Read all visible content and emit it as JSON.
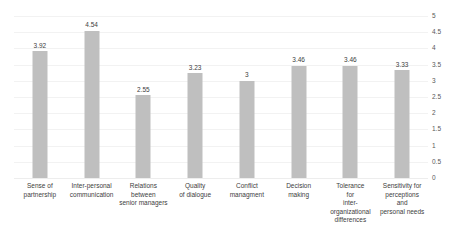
{
  "chart_data": {
    "type": "bar",
    "title": "",
    "subtitle": "",
    "xlabel": "",
    "ylabel": "",
    "ylim": [
      0,
      5
    ],
    "y_ticks": [
      "0",
      "0.5",
      "1",
      "1.5",
      "2",
      "2.5",
      "3",
      "3.5",
      "4",
      "4.5",
      "5"
    ],
    "y_tick_values": [
      0,
      0.5,
      1,
      1.5,
      2,
      2.5,
      3,
      3.5,
      4,
      4.5,
      5
    ],
    "grid": true,
    "legend": "none",
    "y_axis_position": "right",
    "bar_color": "#bfbfbf",
    "categories": [
      "Sense of partnership",
      "Inter-personal communication",
      "Relations between senior managers",
      "Quality of dialogue",
      "Conflict managment",
      "Decision making",
      "Tolerance for inter-organizational differences",
      "Sensitivity for perceptions and personal needs"
    ],
    "category_lines": [
      [
        "Sense of",
        "partnership"
      ],
      [
        "Inter-personal",
        "communication"
      ],
      [
        "Relations",
        "between",
        "senior managers"
      ],
      [
        "Quality",
        "of dialogue"
      ],
      [
        "Conflict",
        "managment"
      ],
      [
        "Decision",
        "making"
      ],
      [
        "Tolerance",
        "for",
        "inter-",
        "organizational",
        "differences"
      ],
      [
        "Sensitivity for",
        "perceptions",
        "and",
        "personal needs"
      ]
    ],
    "values": [
      3.92,
      4.54,
      2.55,
      3.23,
      3,
      3.46,
      3.46,
      3.33
    ],
    "value_labels": [
      "3.92",
      "4.54",
      "2.55",
      "3.23",
      "3",
      "3.46",
      "3.46",
      "3.33"
    ]
  }
}
